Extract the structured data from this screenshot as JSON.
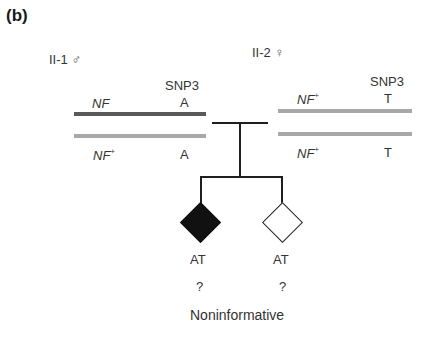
{
  "panel_label": "(b)",
  "parents": [
    {
      "id": "II-1",
      "label": "II-1",
      "sex_symbol": "♂",
      "marker_name": "SNP3",
      "chromosomes": [
        {
          "allele": "NF",
          "allele_sup": "",
          "snp": "A",
          "color": "#5a5a5a"
        },
        {
          "allele": "NF",
          "allele_sup": "+",
          "snp": "A",
          "color": "#a8a8a8"
        }
      ]
    },
    {
      "id": "II-2",
      "label": "II-2",
      "sex_symbol": "♀",
      "marker_name": "SNP3",
      "chromosomes": [
        {
          "allele": "NF",
          "allele_sup": "+",
          "snp": "T",
          "color": "#a8a8a8"
        },
        {
          "allele": "NF",
          "allele_sup": "+",
          "snp": "T",
          "color": "#a8a8a8"
        }
      ]
    }
  ],
  "children": [
    {
      "affected": true,
      "genotype": "AT",
      "status": "?"
    },
    {
      "affected": false,
      "genotype": "AT",
      "status": "?"
    }
  ],
  "conclusion": "Noninformative"
}
